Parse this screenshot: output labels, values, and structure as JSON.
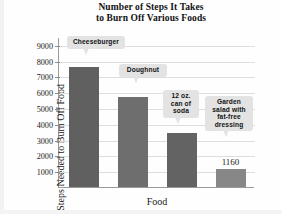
{
  "chart_data": {
    "type": "bar",
    "title": "Number of Steps It Takes to Burn Off Various Foods",
    "title_line1": "Number of Steps It Takes",
    "title_line2": "to Burn Off Various Foods",
    "xlabel": "Food",
    "ylabel": "Steps Needed to Burn Off Food",
    "ylim": [
      0,
      9500
    ],
    "ytick_labels": [
      "9000",
      "8000",
      "7000",
      "6000",
      "5000",
      "4000",
      "3000",
      "2000",
      "1000"
    ],
    "ytick_values": [
      9000,
      8000,
      7000,
      6000,
      5000,
      4000,
      3000,
      2000,
      1000
    ],
    "grid": true,
    "legend": "none",
    "categories": [
      "Cheeseburger",
      "Doughnut",
      "12 oz. can of soda",
      "Garden salad with fat-free dressing"
    ],
    "values": [
      7600,
      5700,
      3450,
      1160
    ],
    "bars": [
      {
        "label": "Cheeseburger",
        "label_lines": [
          "Cheeseburger"
        ],
        "value": 7600,
        "value_label": "",
        "color": "#606060"
      },
      {
        "label": "Doughnut",
        "label_lines": [
          "Doughnut"
        ],
        "value": 5700,
        "value_label": "",
        "color": "#6e6e6e"
      },
      {
        "label": "12 oz. can of soda",
        "label_lines": [
          "12 oz.",
          "can of",
          "soda"
        ],
        "value": 3450,
        "value_label": "",
        "color": "#636363"
      },
      {
        "label": "Garden salad with fat-free dressing",
        "label_lines": [
          "Garden",
          "salad with",
          "fat-free",
          "dressing"
        ],
        "value": 1160,
        "value_label": "1160",
        "color": "#878787"
      }
    ]
  },
  "colors": {
    "callout_bg": "#e3e3e3",
    "axis": "#9a9a9a",
    "grid": "#dedede",
    "text": "#1a1a1a"
  }
}
